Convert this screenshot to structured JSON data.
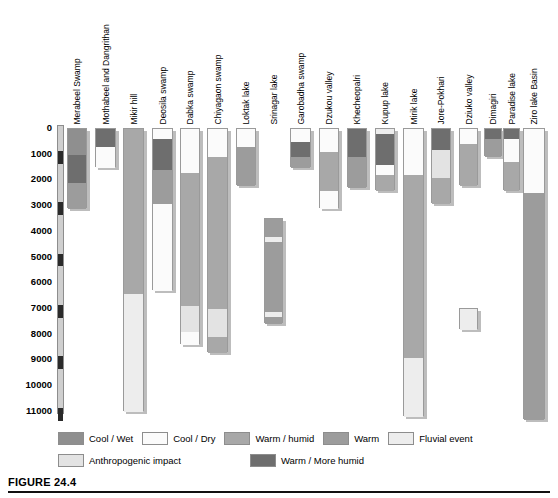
{
  "figure": {
    "caption_label": "FIGURE 24.4",
    "axis": {
      "ylabel": "",
      "ymin": 0,
      "ymax": 11500,
      "ticks": [
        0,
        1000,
        2000,
        3000,
        4000,
        5000,
        6000,
        7000,
        8000,
        9000,
        10000,
        11000
      ],
      "tick_labels": [
        "0",
        "1000",
        "2000",
        "3000",
        "4000",
        "5000",
        "6000",
        "7000",
        "8000",
        "9000",
        "10000",
        "11000"
      ]
    }
  },
  "legend": {
    "rows": [
      [
        {
          "label": "Cool / Wet",
          "color": "#8f8f8f"
        },
        {
          "label": "Cool / Dry",
          "color": "#fbfbfb"
        },
        {
          "label": "Warm / humid",
          "color": "#a8a8a8"
        },
        {
          "label": "Warm",
          "color": "#9c9c9c"
        },
        {
          "label": "Fluvial event",
          "color": "#ededed"
        }
      ],
      [
        {
          "label": "Anthropogenic impact",
          "color": "#e3e3e3"
        },
        {
          "label": "Warm / More humid",
          "color": "#6e6e6e"
        }
      ]
    ]
  },
  "chart_data": {
    "type": "bar",
    "title": "",
    "xlabel": "",
    "ylabel": "Years BP",
    "ylim": [
      0,
      11500
    ],
    "grid": false,
    "legend_position": "bottom",
    "palette": {
      "cool_wet": "#8f8f8f",
      "cool_dry": "#fbfbfb",
      "warm_humid": "#a8a8a8",
      "warm": "#9c9c9c",
      "fluvial_event": "#ededed",
      "anthropogenic_impact": "#e3e3e3",
      "warm_more_humid": "#6e6e6e"
    },
    "categories": [
      "Merabeel Swamp",
      "Mothabeel and Dangrithan",
      "Mikir hill",
      "Deosila swamp",
      "Dabka swamp",
      "Chiyagaon swamp",
      "Loktak lake",
      "Srinagar lake",
      "Garobadha swamp",
      "Dzukou valley",
      "Khecheopalri",
      "Kupup lake",
      "Mirik lake",
      "Jore-Pokhari",
      "Dziuko valley",
      "Dimagiri",
      "Paradise lake",
      "Ziro lake Basin"
    ],
    "columns": [
      {
        "name": "Merabeel Swamp",
        "segments": [
          {
            "from": 0,
            "to": 1000,
            "type": "cool_wet"
          },
          {
            "from": 1000,
            "to": 2100,
            "type": "warm_more_humid"
          },
          {
            "from": 2100,
            "to": 3100,
            "type": "warm"
          }
        ]
      },
      {
        "name": "Mothabeel and Dangrithan",
        "segments": [
          {
            "from": 0,
            "to": 700,
            "type": "warm_more_humid"
          },
          {
            "from": 700,
            "to": 1500,
            "type": "cool_dry"
          }
        ]
      },
      {
        "name": "Mikir hill",
        "segments": [
          {
            "from": 0,
            "to": 6400,
            "type": "warm_humid"
          },
          {
            "from": 6400,
            "to": 11000,
            "type": "fluvial_event"
          }
        ]
      },
      {
        "name": "Deosila swamp",
        "segments": [
          {
            "from": 0,
            "to": 400,
            "type": "cool_dry"
          },
          {
            "from": 400,
            "to": 1600,
            "type": "warm_more_humid"
          },
          {
            "from": 1600,
            "to": 2900,
            "type": "warm"
          },
          {
            "from": 2900,
            "to": 6300,
            "type": "cool_dry"
          }
        ]
      },
      {
        "name": "Dabka swamp",
        "segments": [
          {
            "from": 0,
            "to": 1700,
            "type": "cool_dry"
          },
          {
            "from": 1700,
            "to": 6900,
            "type": "warm_humid"
          },
          {
            "from": 6900,
            "to": 7900,
            "type": "anthropogenic_impact"
          },
          {
            "from": 7900,
            "to": 8400,
            "type": "cool_dry"
          }
        ]
      },
      {
        "name": "Chiyagaon swamp",
        "segments": [
          {
            "from": 0,
            "to": 1100,
            "type": "cool_dry"
          },
          {
            "from": 1100,
            "to": 7000,
            "type": "warm_humid"
          },
          {
            "from": 7000,
            "to": 8100,
            "type": "anthropogenic_impact"
          },
          {
            "from": 8100,
            "to": 8700,
            "type": "warm_humid"
          }
        ]
      },
      {
        "name": "Loktak lake",
        "segments": [
          {
            "from": 0,
            "to": 700,
            "type": "cool_dry"
          },
          {
            "from": 700,
            "to": 2200,
            "type": "warm"
          }
        ]
      },
      {
        "name": "Srinagar lake",
        "segments": [
          {
            "from": 3500,
            "to": 4200,
            "type": "warm"
          },
          {
            "from": 4200,
            "to": 4400,
            "type": "fluvial_event"
          },
          {
            "from": 4400,
            "to": 7100,
            "type": "warm"
          },
          {
            "from": 7100,
            "to": 7300,
            "type": "fluvial_event"
          },
          {
            "from": 7300,
            "to": 7600,
            "type": "warm"
          }
        ]
      },
      {
        "name": "Garobadha swamp",
        "segments": [
          {
            "from": 0,
            "to": 500,
            "type": "cool_dry"
          },
          {
            "from": 500,
            "to": 1100,
            "type": "warm_more_humid"
          },
          {
            "from": 1100,
            "to": 1500,
            "type": "warm"
          }
        ]
      },
      {
        "name": "Dzukou valley",
        "segments": [
          {
            "from": 0,
            "to": 900,
            "type": "cool_dry"
          },
          {
            "from": 900,
            "to": 2400,
            "type": "warm_humid"
          },
          {
            "from": 2400,
            "to": 3100,
            "type": "cool_dry"
          }
        ]
      },
      {
        "name": "Khecheopalri",
        "segments": [
          {
            "from": 0,
            "to": 1100,
            "type": "warm_more_humid"
          },
          {
            "from": 1100,
            "to": 2300,
            "type": "warm"
          }
        ]
      },
      {
        "name": "Kupup lake",
        "segments": [
          {
            "from": 0,
            "to": 200,
            "type": "fluvial_event"
          },
          {
            "from": 200,
            "to": 1400,
            "type": "warm_more_humid"
          },
          {
            "from": 1400,
            "to": 1800,
            "type": "cool_dry"
          },
          {
            "from": 1800,
            "to": 2400,
            "type": "warm_humid"
          }
        ]
      },
      {
        "name": "Mirik lake",
        "segments": [
          {
            "from": 0,
            "to": 1800,
            "type": "cool_dry"
          },
          {
            "from": 1800,
            "to": 8900,
            "type": "warm_humid"
          },
          {
            "from": 8900,
            "to": 11200,
            "type": "fluvial_event"
          }
        ]
      },
      {
        "name": "Jore-Pokhari",
        "segments": [
          {
            "from": 0,
            "to": 800,
            "type": "warm_more_humid"
          },
          {
            "from": 800,
            "to": 1900,
            "type": "anthropogenic_impact"
          },
          {
            "from": 1900,
            "to": 2900,
            "type": "warm_humid"
          }
        ]
      },
      {
        "name": "Dziuko valley",
        "segments": [
          {
            "from": 0,
            "to": 600,
            "type": "cool_dry"
          },
          {
            "from": 600,
            "to": 2200,
            "type": "warm_humid"
          },
          {
            "from": 7000,
            "to": 7800,
            "type": "fluvial_event"
          }
        ]
      },
      {
        "name": "Dimagiri",
        "segments": [
          {
            "from": 0,
            "to": 400,
            "type": "warm_more_humid"
          },
          {
            "from": 400,
            "to": 1100,
            "type": "warm"
          }
        ]
      },
      {
        "name": "Paradise lake",
        "segments": [
          {
            "from": 0,
            "to": 400,
            "type": "warm_more_humid"
          },
          {
            "from": 400,
            "to": 1300,
            "type": "cool_dry"
          },
          {
            "from": 1300,
            "to": 2400,
            "type": "warm_humid"
          }
        ]
      },
      {
        "name": "Ziro lake Basin",
        "segments": [
          {
            "from": 0,
            "to": 2500,
            "type": "cool_dry"
          },
          {
            "from": 2500,
            "to": 11300,
            "type": "warm"
          }
        ]
      }
    ]
  },
  "layout": {
    "columns_px": [
      {
        "name": "Merabeel Swamp",
        "x": 67,
        "w": 20
      },
      {
        "name": "Mothabeel and Dangrithan",
        "x": 95,
        "w": 21
      },
      {
        "name": "Mikir hill",
        "x": 123,
        "w": 21
      },
      {
        "name": "Deosila swamp",
        "x": 152,
        "w": 21
      },
      {
        "name": "Dabka swamp",
        "x": 180,
        "w": 20
      },
      {
        "name": "Chiyagaon swamp",
        "x": 207,
        "w": 21
      },
      {
        "name": "Loktak lake",
        "x": 236,
        "w": 20
      },
      {
        "name": "Srinagar lake",
        "x": 264,
        "w": 19
      },
      {
        "name": "Garobadha swamp",
        "x": 290,
        "w": 21
      },
      {
        "name": "Dzukou valley",
        "x": 319,
        "w": 20
      },
      {
        "name": "Khecheopalri",
        "x": 347,
        "w": 20
      },
      {
        "name": "Kupup lake",
        "x": 375,
        "w": 20
      },
      {
        "name": "Mirik lake",
        "x": 403,
        "w": 21
      },
      {
        "name": "Jore-Pokhari",
        "x": 431,
        "w": 20
      },
      {
        "name": "Dziuko valley",
        "x": 459,
        "w": 19
      },
      {
        "name": "Dimagiri",
        "x": 484,
        "w": 18
      },
      {
        "name": "Paradise lake",
        "x": 503,
        "w": 17
      },
      {
        "name": "Ziro lake Basin",
        "x": 523,
        "w": 22
      }
    ],
    "plot_top_px": 128,
    "px_per_1000": 25.72,
    "label_baseline_px": 124
  }
}
